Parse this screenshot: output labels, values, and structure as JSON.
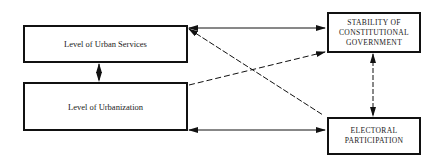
{
  "diagram": {
    "nodes": {
      "urban_services": {
        "label": "Level of Urban Services"
      },
      "urbanization": {
        "label": "Level of Urbanization"
      },
      "stability": {
        "lines": [
          "STABILITY OF",
          "CONSTITUTIONAL",
          "GOVERNMENT"
        ]
      },
      "electoral": {
        "lines": [
          "ELECTORAL",
          "PARTICIPATION"
        ]
      }
    },
    "edges": [
      {
        "from": "urban_services",
        "to": "stability",
        "style": "solid",
        "direction": "bidirectional"
      },
      {
        "from": "urban_services",
        "to": "electoral",
        "style": "dashed",
        "direction": "bidirectional"
      },
      {
        "from": "urbanization",
        "to": "stability",
        "style": "dashed",
        "direction": "to"
      },
      {
        "from": "urbanization",
        "to": "electoral",
        "style": "solid",
        "direction": "bidirectional"
      },
      {
        "from": "urban_services",
        "to": "urbanization",
        "style": "dashed",
        "direction": "bidirectional"
      },
      {
        "from": "stability",
        "to": "electoral",
        "style": "dashed",
        "direction": "bidirectional"
      }
    ],
    "colors": {
      "line": "#111111",
      "text": "#222222",
      "background": "#ffffff"
    }
  }
}
